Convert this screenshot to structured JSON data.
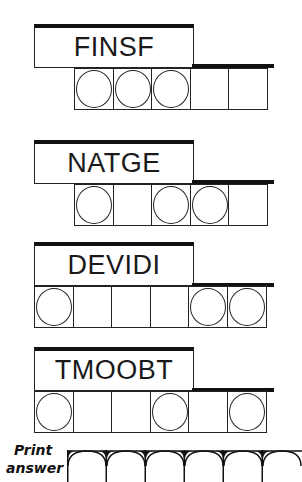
{
  "puzzle": {
    "jumbles": [
      {
        "scrambled": "FINSF",
        "cells": [
          true,
          true,
          true,
          false,
          false
        ],
        "offset": 1
      },
      {
        "scrambled": "NATGE",
        "cells": [
          true,
          false,
          true,
          true,
          false
        ],
        "offset": 1
      },
      {
        "scrambled": "DEVIDI",
        "cells": [
          true,
          false,
          false,
          false,
          true,
          true
        ],
        "offset": 0
      },
      {
        "scrambled": "TMOOBT",
        "cells": [
          true,
          false,
          false,
          true,
          false,
          true
        ],
        "offset": 0
      }
    ],
    "answer": {
      "label_line1": "Print",
      "label_line2": "answer",
      "box_count": 6
    }
  }
}
